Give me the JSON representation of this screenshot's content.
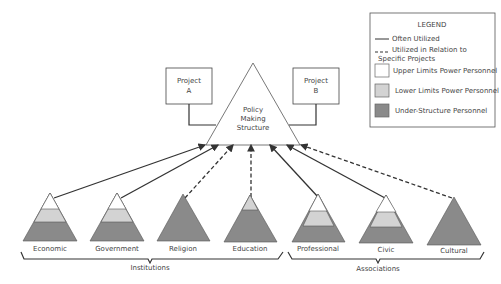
{
  "legend": {
    "title": "LEGEND",
    "items": [
      {
        "type": "solid-line",
        "label": "Often Utilized"
      },
      {
        "type": "dashed-line",
        "label": "Utilized in Relation to",
        "label2": "Specific Projects"
      },
      {
        "type": "swatch",
        "color": "#ffffff",
        "label": "Upper Limits Power Personnel"
      },
      {
        "type": "swatch",
        "color": "#d3d3d3",
        "label": "Lower Limits Power Personnel"
      },
      {
        "type": "swatch",
        "color": "#8a8a8a",
        "label": "Under-Structure Personnel"
      }
    ]
  },
  "center": {
    "line1": "Policy",
    "line2": "Making",
    "line3": "Structure"
  },
  "projects": [
    {
      "line1": "Project",
      "line2": "A"
    },
    {
      "line1": "Project",
      "line2": "B"
    }
  ],
  "pyramids": [
    {
      "label": "Economic",
      "link": "solid",
      "layers": "full"
    },
    {
      "label": "Government",
      "link": "solid",
      "layers": "full"
    },
    {
      "label": "Religion",
      "link": "dashed",
      "layers": "dark"
    },
    {
      "label": "Education",
      "link": "dashed",
      "layers": "lower-dark"
    },
    {
      "label": "Professional",
      "link": "solid",
      "layers": "full"
    },
    {
      "label": "Civic",
      "link": "solid",
      "layers": "full"
    },
    {
      "label": "Cultural",
      "link": "dashed",
      "layers": "dark"
    }
  ],
  "groups": [
    {
      "label": "Institutions"
    },
    {
      "label": "Associations"
    }
  ],
  "colors": {
    "upper": "#ffffff",
    "lower": "#d3d3d3",
    "under": "#8a8a8a",
    "stroke": "#333333"
  }
}
